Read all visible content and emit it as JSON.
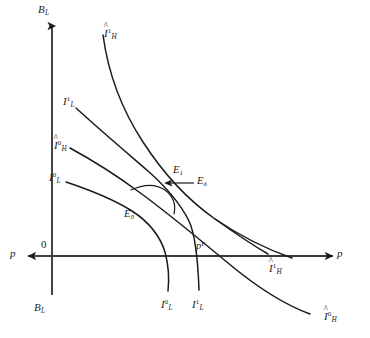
{
  "figure": {
    "type": "indifference-curve-diagram",
    "background_color": "#ffffff",
    "stroke_color": "#1a1a1a",
    "axes": {
      "vertical_top_label": "B",
      "vertical_top_sub": "L",
      "vertical_bottom_label": "B",
      "vertical_bottom_sub": "L",
      "horizontal_right_label": "p",
      "horizontal_left_label": "p",
      "origin_label": "0"
    },
    "curves": [
      {
        "name": "I-hat-H-1-upper",
        "label_base": "I",
        "label_sup": "1",
        "label_sub": "H",
        "hat": true,
        "label_x": 104,
        "label_y": 28
      },
      {
        "name": "I-L-1-upper",
        "label_base": "I",
        "label_sup": "1",
        "label_sub": "L",
        "hat": false,
        "label_x": 63,
        "label_y": 96
      },
      {
        "name": "I-hat-H-0-upper",
        "label_base": "I",
        "label_sup": "0",
        "label_sub": "H",
        "hat": true,
        "label_x": 54,
        "label_y": 140
      },
      {
        "name": "I-L-0-upper",
        "label_base": "I",
        "label_sup": "0",
        "label_sub": "L",
        "hat": false,
        "label_x": 49,
        "label_y": 172
      },
      {
        "name": "I-L-0-lower",
        "label_base": "I",
        "label_sup": "0",
        "label_sub": "L",
        "hat": false,
        "label_x": 161,
        "label_y": 299
      },
      {
        "name": "I-L-1-lower",
        "label_base": "I",
        "label_sup": "1",
        "label_sub": "L",
        "hat": false,
        "label_x": 192,
        "label_y": 299
      },
      {
        "name": "I-hat-H-1-right",
        "label_base": "I",
        "label_sup": "1",
        "label_sub": "H",
        "hat": true,
        "label_x": 269,
        "label_y": 263
      },
      {
        "name": "I-hat-H-0-right",
        "label_base": "I",
        "label_sup": "0",
        "label_sub": "H",
        "hat": true,
        "label_x": 324,
        "label_y": 311
      }
    ],
    "points": [
      {
        "name": "E1",
        "base": "E",
        "sub": "1",
        "x": 173,
        "y": 165
      },
      {
        "name": "Edelta",
        "base": "E",
        "sub": "δ",
        "x": 197,
        "y": 186
      },
      {
        "name": "E0",
        "base": "E",
        "sub": "0",
        "x": 124,
        "y": 209
      },
      {
        "name": "pF",
        "base": "p",
        "sup": "F",
        "x": 196,
        "y": 241
      }
    ]
  }
}
